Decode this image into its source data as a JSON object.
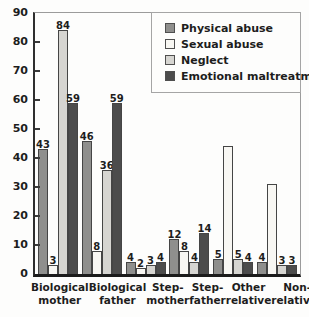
{
  "figure": {
    "background": "#fdfdfc",
    "text_color": "#1d1d1d",
    "axis_color": "#2e2e2e",
    "frame_color": "#9b9b9b"
  },
  "chart_data": {
    "type": "bar",
    "title": "",
    "xlabel": "",
    "ylabel": "",
    "ylim": [
      0,
      90
    ],
    "yticks": [
      0,
      10,
      20,
      30,
      40,
      50,
      60,
      70,
      80,
      90
    ],
    "grid": false,
    "legend_position": "top-right",
    "categories": [
      "Biological mother",
      "Biological father",
      "Step-mother",
      "Step-father",
      "Other relative",
      "Non-relatives"
    ],
    "category_lines": [
      [
        "Biological",
        "mother"
      ],
      [
        "Biological",
        "father"
      ],
      [
        "Step-",
        "mother"
      ],
      [
        "Step-",
        "father"
      ],
      [
        "Other",
        "relative"
      ],
      [
        "Non-",
        "relatives"
      ]
    ],
    "series": [
      {
        "name": "Physical abuse",
        "color": "#8f8f8d",
        "values": [
          43,
          46,
          4,
          12,
          5,
          4
        ],
        "labels": [
          "43",
          "46",
          "4",
          "12",
          "5",
          "4"
        ]
      },
      {
        "name": "Sexual abuse",
        "color": "#f8f7f3",
        "values": [
          3,
          8,
          2,
          8,
          44,
          31
        ],
        "labels": [
          "3",
          "8",
          "2",
          "8",
          "",
          ""
        ]
      },
      {
        "name": "Neglect",
        "color": "#d6d5d1",
        "values": [
          84,
          36,
          3,
          4,
          5,
          3
        ],
        "labels": [
          "84",
          "36",
          "3",
          "4",
          "5",
          "3"
        ]
      },
      {
        "name": "Emotional maltreatment",
        "color": "#4c4c4c",
        "values": [
          59,
          59,
          4,
          14,
          4,
          3
        ],
        "labels": [
          "59",
          "59",
          "4",
          "14",
          "4",
          "3"
        ]
      }
    ]
  }
}
